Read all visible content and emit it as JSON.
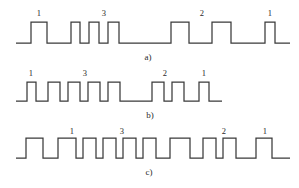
{
  "figure": {
    "width": 299,
    "height": 188,
    "background_color": "#ffffff",
    "line_color": "#3a3a3a",
    "text_color": "#2b2b2b"
  },
  "chart_data": {
    "type": "line",
    "subtitle": "",
    "xlabel": "",
    "ylabel": "",
    "grid": false,
    "legend": "none",
    "axis_ranges": {
      "x": [
        0,
        299
      ],
      "y": [
        0,
        1
      ]
    },
    "series": [
      {
        "name": "a)",
        "caption": "a)",
        "caption_x": 148,
        "baseline_y": 43,
        "high_y": 22,
        "start_x": 16,
        "end_x": 290,
        "pulses": [
          {
            "start": 31,
            "end": 47,
            "label": "1",
            "label_x": 39
          },
          {
            "start": 71,
            "end": 80,
            "label": "",
            "label_x": 0
          },
          {
            "start": 89,
            "end": 99,
            "label": "3",
            "label_x": 104
          },
          {
            "start": 108,
            "end": 119,
            "label": "",
            "label_x": 0
          },
          {
            "start": 171,
            "end": 189,
            "label": "2",
            "label_x": 202
          },
          {
            "start": 212,
            "end": 231,
            "label": "",
            "label_x": 0
          },
          {
            "start": 265,
            "end": 275,
            "label": "1",
            "label_x": 270
          }
        ],
        "annotations": [
          {
            "text": "1",
            "x": 39,
            "y": 9
          },
          {
            "text": "3",
            "x": 104,
            "y": 9
          },
          {
            "text": "2",
            "x": 202,
            "y": 9
          },
          {
            "text": "1",
            "x": 270,
            "y": 9
          }
        ]
      },
      {
        "name": "b)",
        "caption": "b)",
        "caption_x": 150,
        "baseline_y": 101,
        "high_y": 82,
        "start_x": 16,
        "end_x": 222,
        "pulses": [
          {
            "start": 27,
            "end": 36,
            "label": "1",
            "label_x": 31
          },
          {
            "start": 48,
            "end": 60,
            "label": "",
            "label_x": 0
          },
          {
            "start": 68,
            "end": 80,
            "label": "3",
            "label_x": 85
          },
          {
            "start": 88,
            "end": 100,
            "label": "",
            "label_x": 0
          },
          {
            "start": 108,
            "end": 120,
            "label": "",
            "label_x": 0
          },
          {
            "start": 152,
            "end": 164,
            "label": "2",
            "label_x": 165
          },
          {
            "start": 172,
            "end": 184,
            "label": "",
            "label_x": 0
          },
          {
            "start": 199,
            "end": 209,
            "label": "1",
            "label_x": 204
          }
        ],
        "annotations": [
          {
            "text": "1",
            "x": 31,
            "y": 69
          },
          {
            "text": "3",
            "x": 85,
            "y": 69
          },
          {
            "text": "2",
            "x": 165,
            "y": 69
          },
          {
            "text": "1",
            "x": 204,
            "y": 69
          }
        ]
      },
      {
        "name": "c)",
        "caption": "c)",
        "caption_x": 149,
        "baseline_y": 158,
        "high_y": 138,
        "start_x": 16,
        "end_x": 290,
        "pulses": [
          {
            "start": 26,
            "end": 43,
            "label": "",
            "label_x": 0
          },
          {
            "start": 58,
            "end": 76,
            "label": "1",
            "label_x": 72
          },
          {
            "start": 83,
            "end": 96,
            "label": "",
            "label_x": 0
          },
          {
            "start": 103,
            "end": 116,
            "label": "3",
            "label_x": 122
          },
          {
            "start": 123,
            "end": 136,
            "label": "",
            "label_x": 0
          },
          {
            "start": 143,
            "end": 156,
            "label": "",
            "label_x": 0
          },
          {
            "start": 170,
            "end": 190,
            "label": "",
            "label_x": 0
          },
          {
            "start": 203,
            "end": 216,
            "label": "2",
            "label_x": 224
          },
          {
            "start": 223,
            "end": 236,
            "label": "",
            "label_x": 0
          },
          {
            "start": 256,
            "end": 272,
            "label": "1",
            "label_x": 265
          }
        ],
        "annotations": [
          {
            "text": "1",
            "x": 72,
            "y": 127
          },
          {
            "text": "3",
            "x": 122,
            "y": 127
          },
          {
            "text": "2",
            "x": 224,
            "y": 127
          },
          {
            "text": "1",
            "x": 265,
            "y": 127
          }
        ]
      }
    ]
  }
}
